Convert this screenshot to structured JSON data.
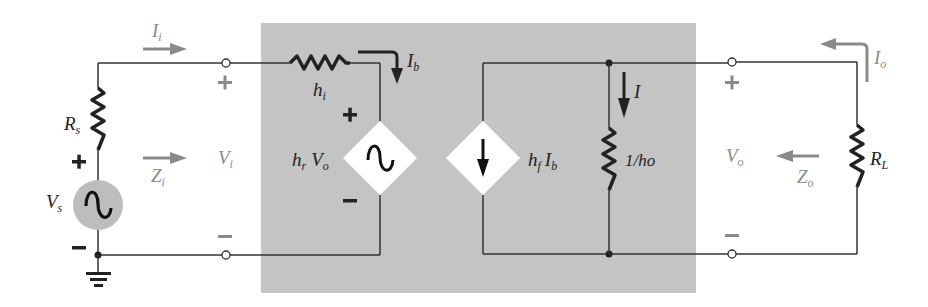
{
  "diagram": {
    "colors": {
      "background": "#ffffff",
      "model_box": "#c4c4c4",
      "wire": "#333333",
      "external_label": "#8a8a8a",
      "arrow_external": "#8a8a8a",
      "source_fill": "#bdbdbd",
      "dependent_source_fill": "#ffffff"
    },
    "input_side": {
      "current_label": "I",
      "current_sub": "i",
      "source_resistor": "R",
      "source_resistor_sub": "s",
      "source_voltage": "V",
      "source_voltage_sub": "s",
      "input_voltage": "V",
      "input_voltage_sub": "i",
      "input_impedance": "Z",
      "input_impedance_sub": "i",
      "plus": "+",
      "minus": "−"
    },
    "model": {
      "input_resistance": "h",
      "input_resistance_sub": "i",
      "base_current": "I",
      "base_current_sub": "b",
      "feedback_source_h": "h",
      "feedback_source_h_sub": "r",
      "feedback_source_v": "V",
      "feedback_source_v_sub": "o",
      "forward_source_h": "h",
      "forward_source_h_sub": "f",
      "forward_source_i": "I",
      "forward_source_i_sub": "b",
      "output_conductance": "1/ho",
      "branch_current": "I",
      "plus": "+",
      "minus": "−"
    },
    "output_side": {
      "output_current": "I",
      "output_current_sub": "o",
      "output_voltage": "V",
      "output_voltage_sub": "o",
      "output_impedance": "Z",
      "output_impedance_sub": "o",
      "load_resistor": "R",
      "load_resistor_sub": "L",
      "plus": "+",
      "minus": "−"
    }
  }
}
